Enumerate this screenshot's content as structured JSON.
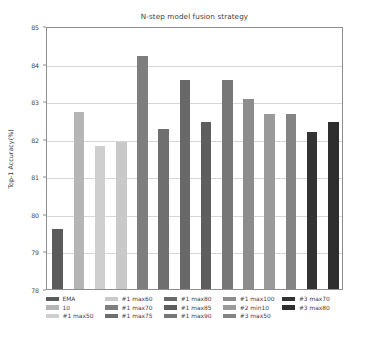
{
  "chart_data": {
    "type": "bar",
    "title": "N-step model fusion strategy",
    "xlabel": "",
    "ylabel": "Top-1 Accuracy(%)",
    "ylim": [
      78,
      85
    ],
    "yticks": [
      78,
      79,
      80,
      81,
      82,
      83,
      84,
      85
    ],
    "ytick_labels": [
      "78",
      "79",
      "80",
      "81",
      "82",
      "83",
      "84",
      "85"
    ],
    "xticks": [],
    "xtick_labels": [],
    "grid": "horizontal",
    "legend_position": "below",
    "categories": [
      "EMA",
      "10",
      "#1 max50",
      "#1 max55",
      "#1 max60",
      "#1 max70",
      "#1 max75",
      "#1 max80",
      "#1 max85",
      "#1 max90",
      "#1 max100",
      "#2 min10",
      "#3 max50",
      "#3 max70"
    ],
    "values": [
      79.6,
      82.7,
      81.8,
      81.9,
      84.2,
      82.25,
      83.55,
      82.45,
      83.57,
      83.07,
      82.67,
      82.67,
      82.18,
      82.45
    ],
    "colors": [
      "#5b5b5b",
      "#b5b5b5",
      "#cfcfcf",
      "#c9c9c9",
      "#7e7e7e",
      "#6f6f6f",
      "#686868",
      "#5e5e5e",
      "#777777",
      "#8c8c8c",
      "#9a9a9a",
      "#848484",
      "#333333",
      "#2e2e2e"
    ]
  },
  "legend": {
    "columns": [
      {
        "entries": [
          {
            "label": "EMA",
            "color": "#5b5b5b"
          },
          {
            "label": "10",
            "color": "#b5b5b5"
          },
          {
            "label": "#1 max50",
            "color": "#cfcfcf"
          }
        ]
      },
      {
        "entries": [
          {
            "label": "#1 max60",
            "color": "#c9c9c9"
          },
          {
            "label": "#1 max70",
            "color": "#7e7e7e"
          },
          {
            "label": "#1 max75",
            "color": "#6f6f6f"
          }
        ]
      },
      {
        "entries": [
          {
            "label": "#1 max80",
            "color": "#686868"
          },
          {
            "label": "#1 max85",
            "color": "#5e5e5e"
          },
          {
            "label": "#1 max90",
            "color": "#777777"
          }
        ]
      },
      {
        "entries": [
          {
            "label": "#1 max100",
            "color": "#8c8c8c"
          },
          {
            "label": "#2 min10",
            "color": "#9a9a9a"
          },
          {
            "label": "#3 max50",
            "color": "#848484"
          }
        ]
      },
      {
        "entries": [
          {
            "label": "#3 max70",
            "color": "#333333"
          },
          {
            "label": "#3 max80",
            "color": "#2e2e2e"
          }
        ]
      }
    ]
  }
}
